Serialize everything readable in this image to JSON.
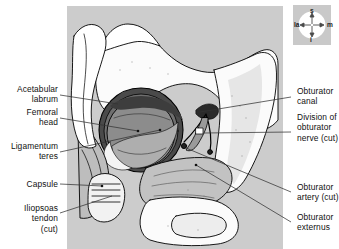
{
  "figure": {
    "title_alt": "Right hip joint opened anteriorly, femoral head dislocated",
    "panel_bg": "#cccccc",
    "ink": "#000000"
  },
  "orientation_key": {
    "name": "orientation-compass",
    "superior": "s",
    "inferior": "i",
    "lateral": "la",
    "medial": "m",
    "box_color": "#c9c9c9"
  },
  "labels_left": [
    {
      "id": "acetabular-labrum",
      "text": "Acetabular\nlabrum"
    },
    {
      "id": "femoral-head",
      "text": "Femoral\nhead"
    },
    {
      "id": "ligamentum-teres",
      "text": "Ligamentum\nteres"
    },
    {
      "id": "capsule",
      "text": "Capsule"
    },
    {
      "id": "iliopsoas-tendon",
      "text": "Iliopsoas\ntendon\n(cut)"
    }
  ],
  "labels_right": [
    {
      "id": "obturator-canal",
      "text": "Obturator\ncanal"
    },
    {
      "id": "division-obturator-nerve",
      "text": "Division of\nobturator\nnerve (cut)"
    },
    {
      "id": "obturator-artery",
      "text": "Obturator\nartery (cut)"
    },
    {
      "id": "obturator-externus",
      "text": "Obturator\nexternus"
    }
  ],
  "anatomy_regions": [
    {
      "id": "femoral-head-cartilage",
      "fill": "#8c8c8c"
    },
    {
      "id": "acetabular-labrum-rim",
      "fill": "#4a4a4a"
    },
    {
      "id": "ligamentum-teres-wedge",
      "fill": "#a5a5a5"
    },
    {
      "id": "capsule-sheet",
      "fill": "#b6b6b6"
    },
    {
      "id": "bone-surface",
      "fill": "#fbfbfb"
    }
  ]
}
